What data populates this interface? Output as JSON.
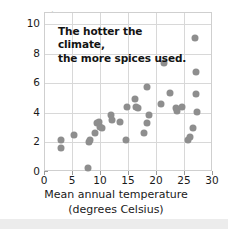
{
  "chart_data": {
    "type": "scatter",
    "title": "",
    "annotation": {
      "line1": "The hotter the climate,",
      "line2": "the more spices used."
    },
    "xlabel_line1": "Mean annual temperature",
    "xlabel_line2": "(degrees Celsius)",
    "ylabel": "Spices per recipe",
    "xlim": [
      0,
      30
    ],
    "ylim": [
      0,
      10.7
    ],
    "xticks": [
      0,
      5,
      10,
      15,
      20,
      25,
      30
    ],
    "yticks": [
      0,
      2,
      4,
      6,
      8,
      10
    ],
    "xticklabels": [
      "0",
      "5",
      "10",
      "15",
      "20",
      "25",
      "30"
    ],
    "yticklabels": [
      "0",
      "2",
      "4",
      "6",
      "8",
      "10"
    ],
    "grid": "both",
    "legend": "none",
    "marker_color": "#8e8e8e",
    "grid_color": "#d8d8d8",
    "frame_color": "#cfcfcf",
    "points": [
      {
        "x": 2.8,
        "y": 2.15
      },
      {
        "x": 2.8,
        "y": 1.6
      },
      {
        "x": 5.2,
        "y": 2.5
      },
      {
        "x": 7.6,
        "y": 0.3
      },
      {
        "x": 7.8,
        "y": 2.0
      },
      {
        "x": 8.1,
        "y": 2.15
      },
      {
        "x": 8.9,
        "y": 2.65
      },
      {
        "x": 9.2,
        "y": 3.3
      },
      {
        "x": 9.6,
        "y": 3.35
      },
      {
        "x": 9.9,
        "y": 3.0
      },
      {
        "x": 10.2,
        "y": 2.95
      },
      {
        "x": 11.7,
        "y": 3.85
      },
      {
        "x": 12.0,
        "y": 3.5
      },
      {
        "x": 13.4,
        "y": 3.35
      },
      {
        "x": 14.4,
        "y": 2.15
      },
      {
        "x": 14.6,
        "y": 4.4
      },
      {
        "x": 16.0,
        "y": 4.9
      },
      {
        "x": 16.3,
        "y": 4.35
      },
      {
        "x": 16.6,
        "y": 4.3
      },
      {
        "x": 17.6,
        "y": 2.6
      },
      {
        "x": 18.3,
        "y": 5.75
      },
      {
        "x": 18.2,
        "y": 3.3
      },
      {
        "x": 18.6,
        "y": 3.85
      },
      {
        "x": 20.7,
        "y": 4.6
      },
      {
        "x": 21.3,
        "y": 7.35
      },
      {
        "x": 22.3,
        "y": 5.3
      },
      {
        "x": 23.4,
        "y": 4.3
      },
      {
        "x": 23.6,
        "y": 4.1
      },
      {
        "x": 24.4,
        "y": 4.4
      },
      {
        "x": 25.6,
        "y": 2.15
      },
      {
        "x": 25.9,
        "y": 2.35
      },
      {
        "x": 26.4,
        "y": 2.95
      },
      {
        "x": 26.8,
        "y": 9.05
      },
      {
        "x": 26.9,
        "y": 6.75
      },
      {
        "x": 26.9,
        "y": 5.25
      },
      {
        "x": 27.1,
        "y": 4.05
      }
    ]
  }
}
